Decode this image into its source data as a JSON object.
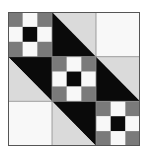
{
  "quilt": {
    "name": "Jacob's Ladder style nine-patch diagonal block",
    "grid": 3,
    "colors": {
      "background": "#ffffff",
      "white": "#f8f8f8",
      "dark_gray": "#7a7a7a",
      "black": "#0a0a0a",
      "light_gray": "#dadada",
      "seam": "#8a8a8a"
    },
    "cells": [
      {
        "row": 0,
        "col": 0,
        "type": "nine-patch"
      },
      {
        "row": 0,
        "col": 1,
        "type": "half-square",
        "tr": "light_gray",
        "bl": "black"
      },
      {
        "row": 0,
        "col": 2,
        "type": "plain",
        "fill": "white"
      },
      {
        "row": 1,
        "col": 0,
        "type": "half-square",
        "tr": "black",
        "bl": "light_gray"
      },
      {
        "row": 1,
        "col": 1,
        "type": "nine-patch"
      },
      {
        "row": 1,
        "col": 2,
        "type": "half-square",
        "tr": "light_gray",
        "bl": "black"
      },
      {
        "row": 2,
        "col": 0,
        "type": "plain",
        "fill": "white"
      },
      {
        "row": 2,
        "col": 1,
        "type": "half-square",
        "tr": "black",
        "bl": "light_gray"
      },
      {
        "row": 2,
        "col": 2,
        "type": "nine-patch"
      }
    ],
    "nine_patch": [
      [
        "dark_gray",
        "white",
        "dark_gray"
      ],
      [
        "white",
        "black",
        "white"
      ],
      [
        "dark_gray",
        "white",
        "dark_gray"
      ]
    ]
  }
}
